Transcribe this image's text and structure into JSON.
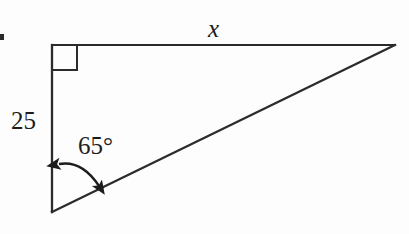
{
  "figure": {
    "kind": "geometry-diagram",
    "background_color": "#fdfdfd",
    "stroke_color": "#2b2b2b",
    "text_color": "#1c1c1c",
    "labels": {
      "unknown_side": "x",
      "known_side": "25",
      "angle": "65°"
    },
    "geometry": {
      "vertices": {
        "top_left": [
          52,
          45
        ],
        "top_right": [
          395,
          45
        ],
        "bottom_left": [
          52,
          212
        ]
      },
      "right_angle_marker": {
        "at_vertex": "top_left",
        "size": 25
      },
      "angle_arc": {
        "at_vertex": "bottom_left",
        "value": 65,
        "unit": "degrees",
        "double_headed": true
      },
      "side_labels": {
        "top": "x",
        "left": "25"
      }
    }
  }
}
